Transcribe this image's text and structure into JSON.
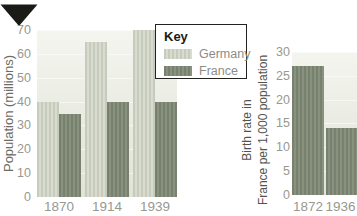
{
  "icons": {
    "corner_marker": "triangle-down"
  },
  "colors": {
    "background": "#ffffff",
    "marker": "#1a1a17",
    "germany_bar": "#c6cbbd",
    "germany_bar_stripe": "#d8dccf",
    "france_bar": "#78816e",
    "france_bar_stripe": "#89917f",
    "plot_bg_top": "#f4f5ef",
    "plot_bg_bottom": "#e0e3d7",
    "tick_text": "#98988f",
    "axis_title_left": "#6d6d65",
    "axis_title_right": "#53534c",
    "key_border": "#22221e",
    "key_title_text": "#1b1b17",
    "key_label_text": "#8d8d85"
  },
  "chart_data": [
    {
      "type": "bar",
      "ylabel": "Population (millions)",
      "categories": [
        "1870",
        "1914",
        "1939"
      ],
      "series": [
        {
          "name": "Germany",
          "values": [
            40,
            65,
            70
          ]
        },
        {
          "name": "France",
          "values": [
            35,
            40,
            40
          ]
        }
      ],
      "ylim": [
        0,
        70
      ],
      "yticks": [
        70,
        60,
        50,
        40,
        30,
        20,
        10,
        0
      ],
      "grid": true,
      "legend_title": "Key",
      "legend_position": "top-right"
    },
    {
      "type": "bar",
      "ylabel": "Birth rate in France per 1,000 population",
      "ylabel_lines": [
        "Birth rate in",
        "France per 1,000 population"
      ],
      "categories": [
        "1872",
        "1936"
      ],
      "values": [
        27,
        14
      ],
      "series_color_name": "France",
      "ylim": [
        0,
        30
      ],
      "yticks": [
        30,
        25,
        20,
        15,
        10,
        5,
        0
      ],
      "grid": true
    }
  ]
}
